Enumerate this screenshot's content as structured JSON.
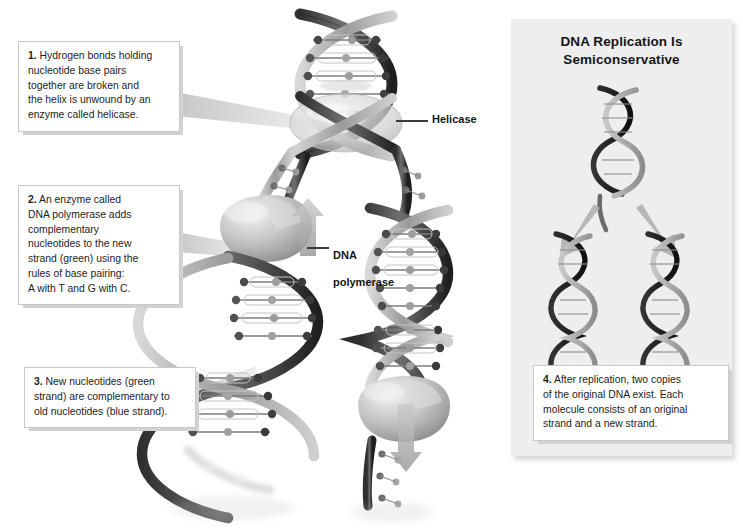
{
  "figure": {
    "top_caption_fragment": "",
    "background": "#ffffff"
  },
  "right_panel": {
    "title_line_1": "DNA Replication Is",
    "title_line_2": "Semiconservative",
    "background": "#eeeeef",
    "diagram": {
      "parent_molecule_label": "original DNA double helix",
      "daughter_molecule_left_label": "daughter DNA molecule",
      "daughter_molecule_right_label": "daughter DNA molecule",
      "arrow_count": 2
    }
  },
  "callouts": [
    {
      "id": "callout-1",
      "number": "1.",
      "lines": [
        "Hydrogen bonds holding",
        "nucleotide base pairs",
        "together are broken and",
        "the helix is unwound by an",
        "enzyme called helicase."
      ]
    },
    {
      "id": "callout-2",
      "number": "2.",
      "lines": [
        "An enzyme called",
        "DNA polymerase adds",
        "complementary",
        "nucleotides to the new",
        "strand (green) using the",
        "rules of base pairing:",
        "A with T and G with C."
      ]
    },
    {
      "id": "callout-3",
      "number": "3.",
      "lines": [
        "New nucleotides (green",
        "strand) are complementary to",
        "old nucleotides (blue strand)."
      ]
    },
    {
      "id": "callout-4",
      "number": "4.",
      "lines": [
        "After replication, two copies",
        "of the original DNA exist. Each",
        "molecule consists of an original",
        "strand and a new strand."
      ]
    }
  ],
  "art_labels": {
    "helicase": "Helicase",
    "polymerase_line_1": "DNA",
    "polymerase_line_2": "polymerase"
  },
  "colors": {
    "panel_background": "#eeeeef",
    "callout_border": "#c8c8c8",
    "callout_shadow": "#d2d2d2",
    "text": "#1d1d1d",
    "backbone_dark": "#3c3c3c",
    "backbone_light": "#b9b9b9",
    "base_mid": "#8a8a8a",
    "pointer_wedge": "#c9c9c9"
  }
}
